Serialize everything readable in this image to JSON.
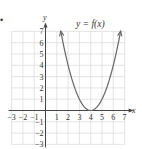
{
  "chart_data": {
    "type": "line",
    "title": "y = f(x)",
    "xlabel": "x",
    "ylabel": "y",
    "xlim": [
      -3,
      7
    ],
    "ylim": [
      -3,
      7
    ],
    "grid": true,
    "x_ticks": [
      -3,
      -2,
      -1,
      1,
      2,
      3,
      4,
      5,
      6,
      7
    ],
    "y_ticks": [
      -3,
      -2,
      -1,
      1,
      2,
      3,
      4,
      5,
      6,
      7
    ],
    "series": [
      {
        "name": "f(x)",
        "function": "(x-4)^2",
        "x": [
          1.35,
          2,
          3,
          4,
          5,
          6,
          6.65
        ],
        "y": [
          7,
          4,
          1,
          0,
          1,
          4,
          7
        ],
        "arrows_at_ends": true,
        "color": "#666666"
      }
    ],
    "vertex": [
      4,
      0
    ]
  },
  "bullet": "•",
  "colors": {
    "grid": "#d8d8d8",
    "axis": "#444444",
    "curve": "#666666",
    "text": "#333333"
  }
}
